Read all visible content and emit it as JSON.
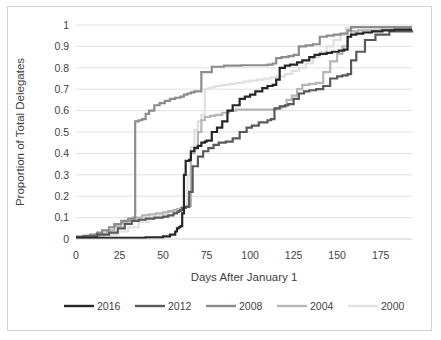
{
  "chart_data": {
    "type": "line",
    "title": "",
    "subtitle": "",
    "xlabel": "Days After January 1",
    "ylabel": "Proportion of Total Delegates",
    "xlim": [
      0,
      193
    ],
    "ylim": [
      0,
      1
    ],
    "xticks": [
      0,
      25,
      50,
      75,
      100,
      125,
      150,
      175
    ],
    "yticks": [
      0,
      0.1,
      0.2,
      0.3,
      0.4,
      0.5,
      0.6,
      0.7,
      0.8,
      0.9,
      1
    ],
    "xtick_labels": [
      "0",
      "25",
      "50",
      "75",
      "100",
      "125",
      "150",
      "175"
    ],
    "ytick_labels": [
      "0",
      "0.1",
      "0.2",
      "0.3",
      "0.4",
      "0.5",
      "0.6",
      "0.7",
      "0.8",
      "0.9",
      "1"
    ],
    "grid": "horizontal",
    "legend_position": "bottom",
    "step_type": "post",
    "series": [
      {
        "name": "2016",
        "color": "#262626",
        "width": 2.2,
        "x": [
          0,
          31,
          40,
          50,
          54,
          57,
          58,
          59,
          60,
          61,
          62,
          63,
          65,
          66,
          68,
          70,
          72,
          74,
          75,
          78,
          81,
          84,
          87,
          90,
          94,
          97,
          100,
          103,
          107,
          110,
          113,
          115,
          117,
          120,
          123,
          127,
          130,
          134,
          137,
          140,
          144,
          147,
          151,
          154,
          156,
          158,
          161,
          165,
          170,
          176,
          183,
          193
        ],
        "y": [
          0.005,
          0.005,
          0.008,
          0.012,
          0.02,
          0.035,
          0.05,
          0.055,
          0.06,
          0.12,
          0.3,
          0.365,
          0.37,
          0.41,
          0.425,
          0.435,
          0.45,
          0.455,
          0.46,
          0.5,
          0.52,
          0.55,
          0.6,
          0.625,
          0.655,
          0.665,
          0.675,
          0.69,
          0.705,
          0.715,
          0.72,
          0.745,
          0.8,
          0.81,
          0.815,
          0.825,
          0.835,
          0.85,
          0.86,
          0.865,
          0.87,
          0.875,
          0.88,
          0.885,
          0.945,
          0.955,
          0.96,
          0.965,
          0.97,
          0.975,
          0.978,
          0.978
        ]
      },
      {
        "name": "2012",
        "color": "#595959",
        "width": 2.2,
        "x": [
          0,
          5,
          12,
          19,
          24,
          28,
          32,
          36,
          40,
          45,
          50,
          53,
          56,
          58,
          59,
          60,
          61,
          63,
          65,
          67,
          70,
          73,
          76,
          79,
          82,
          86,
          90,
          94,
          98,
          101,
          105,
          110,
          112,
          114,
          117,
          120,
          122,
          125,
          128,
          131,
          134,
          138,
          142,
          146,
          150,
          153,
          156,
          158,
          161,
          166,
          172,
          180,
          193
        ],
        "y": [
          0.01,
          0.012,
          0.02,
          0.03,
          0.05,
          0.07,
          0.085,
          0.09,
          0.095,
          0.1,
          0.105,
          0.11,
          0.12,
          0.125,
          0.13,
          0.135,
          0.145,
          0.15,
          0.22,
          0.34,
          0.385,
          0.41,
          0.425,
          0.44,
          0.45,
          0.455,
          0.47,
          0.5,
          0.52,
          0.53,
          0.545,
          0.555,
          0.56,
          0.61,
          0.62,
          0.625,
          0.63,
          0.655,
          0.68,
          0.69,
          0.695,
          0.7,
          0.715,
          0.75,
          0.76,
          0.765,
          0.77,
          0.835,
          0.875,
          0.93,
          0.955,
          0.97,
          0.975
        ]
      },
      {
        "name": "2008",
        "color": "#8c8c8c",
        "width": 2.2,
        "x": [
          0,
          4,
          8,
          12,
          15,
          19,
          22,
          26,
          30,
          33,
          34,
          36,
          38,
          40,
          42,
          45,
          48,
          51,
          54,
          57,
          60,
          62,
          64,
          66,
          68,
          72,
          78,
          85,
          95,
          105,
          110,
          113,
          115,
          118,
          122,
          125,
          128,
          132,
          136,
          140,
          144,
          148,
          152,
          156,
          158,
          162,
          168,
          175,
          185,
          193
        ],
        "y": [
          0.01,
          0.015,
          0.02,
          0.03,
          0.04,
          0.055,
          0.07,
          0.085,
          0.095,
          0.1,
          0.55,
          0.555,
          0.56,
          0.585,
          0.6,
          0.625,
          0.635,
          0.645,
          0.655,
          0.66,
          0.665,
          0.675,
          0.68,
          0.685,
          0.69,
          0.78,
          0.805,
          0.81,
          0.812,
          0.812,
          0.815,
          0.82,
          0.845,
          0.85,
          0.855,
          0.86,
          0.9,
          0.905,
          0.91,
          0.945,
          0.95,
          0.955,
          0.96,
          0.975,
          0.99,
          0.99,
          0.99,
          0.99,
          0.99,
          0.99
        ]
      },
      {
        "name": "2004",
        "color": "#b5b5b5",
        "width": 2.2,
        "x": [
          0,
          6,
          13,
          18,
          22,
          26,
          30,
          34,
          38,
          42,
          46,
          50,
          53,
          56,
          58,
          60,
          62,
          64,
          66,
          68,
          70,
          72,
          74,
          77,
          80,
          84,
          88,
          92,
          96,
          100,
          104,
          108,
          112,
          115,
          118,
          121,
          124,
          127,
          130,
          134,
          138,
          142,
          146,
          150,
          153,
          156,
          158,
          162,
          168,
          175,
          185,
          193
        ],
        "y": [
          0.01,
          0.015,
          0.025,
          0.04,
          0.06,
          0.075,
          0.085,
          0.1,
          0.11,
          0.115,
          0.12,
          0.125,
          0.13,
          0.135,
          0.14,
          0.145,
          0.15,
          0.155,
          0.4,
          0.43,
          0.5,
          0.555,
          0.57,
          0.575,
          0.58,
          0.59,
          0.6,
          0.605,
          0.605,
          0.605,
          0.605,
          0.605,
          0.605,
          0.61,
          0.62,
          0.65,
          0.67,
          0.7,
          0.72,
          0.725,
          0.73,
          0.78,
          0.83,
          0.865,
          0.9,
          0.945,
          0.97,
          0.975,
          0.975,
          0.978,
          0.978,
          0.978
        ]
      },
      {
        "name": "2000",
        "color": "#e0e0e0",
        "width": 2.2,
        "x": [
          0,
          8,
          16,
          24,
          30,
          36,
          42,
          48,
          52,
          55,
          58,
          60,
          62,
          64,
          66,
          68,
          70,
          72,
          74,
          76,
          78,
          80,
          84,
          88,
          92,
          96,
          100,
          104,
          108,
          112,
          116,
          120,
          124,
          128,
          132,
          136,
          140,
          144,
          148,
          152,
          155,
          158,
          162,
          168,
          175,
          185,
          193
        ],
        "y": [
          0.008,
          0.012,
          0.02,
          0.035,
          0.055,
          0.08,
          0.1,
          0.115,
          0.125,
          0.13,
          0.135,
          0.14,
          0.15,
          0.3,
          0.43,
          0.51,
          0.55,
          0.58,
          0.7,
          0.705,
          0.71,
          0.715,
          0.72,
          0.725,
          0.73,
          0.735,
          0.74,
          0.745,
          0.75,
          0.755,
          0.76,
          0.77,
          0.785,
          0.8,
          0.82,
          0.85,
          0.875,
          0.9,
          0.93,
          0.955,
          0.985,
          0.99,
          0.99,
          0.99,
          0.99,
          0.99,
          0.99
        ]
      }
    ]
  },
  "legend": {
    "items": [
      {
        "label": "2016",
        "color": "#262626"
      },
      {
        "label": "2012",
        "color": "#595959"
      },
      {
        "label": "2008",
        "color": "#8c8c8c"
      },
      {
        "label": "2004",
        "color": "#b5b5b5"
      },
      {
        "label": "2000",
        "color": "#e0e0e0"
      }
    ]
  },
  "axes": {
    "x_title": "Days After January 1",
    "y_title": "Proportion of Total Delegates"
  },
  "colors": {
    "gridline": "#d9d9d9",
    "text": "#3f3f3f",
    "frame": "#d2d2d2",
    "background": "#ffffff"
  }
}
